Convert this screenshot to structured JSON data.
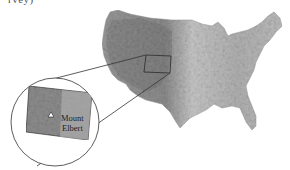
{
  "caption_fragment": "rvey)",
  "map": {
    "subject": "Contiguous United States shaded relief",
    "highlight_region": "Colorado",
    "inset": {
      "label_line1": "Mount",
      "label_line2": "Elbert",
      "marker_icon": "mountain-peak-icon"
    }
  },
  "colors": {
    "background": "#ffffff",
    "line": "#333333",
    "map_light": "#d4d4d4",
    "map_mid": "#a8a8a8",
    "map_dark": "#7a7a7a"
  }
}
